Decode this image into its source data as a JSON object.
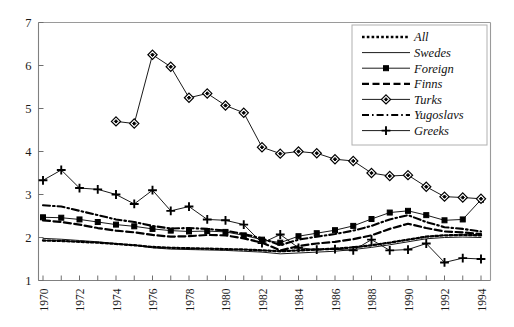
{
  "chart_data": {
    "type": "line",
    "title": "",
    "subtitle": "",
    "xlabel": "",
    "ylabel": "",
    "xlim": [
      1970,
      1994
    ],
    "ylim": [
      1,
      7
    ],
    "yticks": [
      1,
      2,
      3,
      4,
      5,
      6,
      7
    ],
    "ytick_labels": [
      "1",
      "2",
      "3",
      "4",
      "5",
      "6",
      "7"
    ],
    "xticks": [
      1970,
      1971,
      1972,
      1973,
      1974,
      1975,
      1976,
      1977,
      1978,
      1979,
      1980,
      1981,
      1982,
      1983,
      1984,
      1985,
      1986,
      1987,
      1988,
      1989,
      1990,
      1991,
      1992,
      1993,
      1994
    ],
    "xtick_labels_shown": [
      "1970",
      "1972",
      "1974",
      "1976",
      "1978",
      "1980",
      "1982",
      "1984",
      "1986",
      "1988",
      "1990",
      "1992",
      "1994"
    ],
    "grid": false,
    "legend_position": "top-right",
    "x": [
      1970,
      1971,
      1972,
      1973,
      1974,
      1975,
      1976,
      1977,
      1978,
      1979,
      1980,
      1981,
      1982,
      1983,
      1984,
      1985,
      1986,
      1987,
      1988,
      1989,
      1990,
      1991,
      1992,
      1993,
      1994
    ],
    "series": [
      {
        "name": "All",
        "style": "dotted",
        "marker": "none",
        "values": [
          1.93,
          1.92,
          1.9,
          1.88,
          1.85,
          1.82,
          1.78,
          1.76,
          1.75,
          1.74,
          1.73,
          1.72,
          1.7,
          1.68,
          1.7,
          1.72,
          1.74,
          1.77,
          1.82,
          1.88,
          1.95,
          2.02,
          2.05,
          2.06,
          2.05
        ]
      },
      {
        "name": "Swedes",
        "style": "solid-thin",
        "marker": "none",
        "values": [
          1.98,
          1.96,
          1.93,
          1.9,
          1.86,
          1.82,
          1.76,
          1.73,
          1.72,
          1.71,
          1.7,
          1.68,
          1.66,
          1.62,
          1.64,
          1.66,
          1.68,
          1.72,
          1.77,
          1.83,
          1.9,
          1.97,
          2.0,
          2.01,
          2.0
        ]
      },
      {
        "name": "Foreign",
        "style": "solid-marker",
        "marker": "square",
        "values": [
          2.47,
          2.46,
          2.42,
          2.36,
          2.3,
          2.26,
          2.2,
          2.16,
          2.14,
          2.15,
          2.13,
          2.05,
          1.95,
          1.88,
          2.03,
          2.1,
          2.17,
          2.27,
          2.43,
          2.58,
          2.62,
          2.52,
          2.4,
          2.42,
          2.88
        ]
      },
      {
        "name": "Finns",
        "style": "dashed",
        "marker": "none",
        "values": [
          2.4,
          2.36,
          2.3,
          2.22,
          2.16,
          2.12,
          2.06,
          2.02,
          2.03,
          2.06,
          2.05,
          1.98,
          1.88,
          1.7,
          1.8,
          1.86,
          1.9,
          1.96,
          2.05,
          2.2,
          2.32,
          2.22,
          2.14,
          2.12,
          2.08
        ]
      },
      {
        "name": "Turks",
        "style": "solid-marker",
        "marker": "diamond",
        "values": [
          null,
          null,
          null,
          null,
          4.7,
          4.65,
          6.25,
          5.97,
          5.25,
          5.35,
          5.07,
          4.9,
          4.1,
          3.95,
          4.0,
          3.96,
          3.82,
          3.78,
          3.5,
          3.43,
          3.45,
          3.18,
          2.95,
          2.93,
          2.9
        ]
      },
      {
        "name": "Yugoslavs",
        "style": "dash-dot",
        "marker": "none",
        "values": [
          2.75,
          2.72,
          2.62,
          2.52,
          2.42,
          2.36,
          2.27,
          2.21,
          2.22,
          2.2,
          2.16,
          2.08,
          1.98,
          1.82,
          1.95,
          2.02,
          2.08,
          2.16,
          2.27,
          2.42,
          2.52,
          2.36,
          2.24,
          2.2,
          2.14
        ]
      },
      {
        "name": "Greeks",
        "style": "solid-marker",
        "marker": "plus",
        "values": [
          3.33,
          3.57,
          3.15,
          3.12,
          3.0,
          2.78,
          3.1,
          2.62,
          2.72,
          2.42,
          2.4,
          2.3,
          1.87,
          2.07,
          1.76,
          1.72,
          1.73,
          1.7,
          1.95,
          1.7,
          1.72,
          1.86,
          1.42,
          1.52,
          1.5
        ]
      }
    ]
  },
  "legend": {
    "items": [
      {
        "label": "All"
      },
      {
        "label": "Swedes"
      },
      {
        "label": "Foreign"
      },
      {
        "label": "Finns"
      },
      {
        "label": "Turks"
      },
      {
        "label": "Yugoslavs"
      },
      {
        "label": "Greeks"
      }
    ]
  },
  "axes": {
    "y_tick_labels": [
      "7",
      "6",
      "5",
      "4",
      "3",
      "2",
      "1"
    ],
    "x_tick_labels": [
      "1970",
      "1972",
      "1974",
      "1976",
      "1978",
      "1980",
      "1982",
      "1984",
      "1986",
      "1988",
      "1990",
      "1992",
      "1994"
    ]
  },
  "colors": {
    "ink": "#000000",
    "axis": "#808080",
    "background": "#ffffff"
  }
}
